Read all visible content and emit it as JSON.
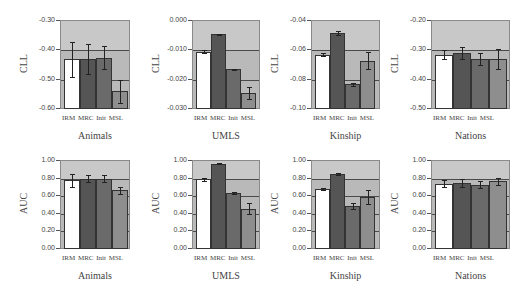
{
  "chart_data": [
    {
      "type": "bar",
      "panel": "top-1",
      "title": "Animals",
      "ylabel": "CLL",
      "categories": [
        "IRM",
        "MRC",
        "Init",
        "MSL"
      ],
      "ylim": [
        -0.6,
        -0.3
      ],
      "yticks": [
        "-0.30",
        "-0.40",
        "-0.50",
        "-0.60"
      ],
      "values": [
        -0.43,
        -0.43,
        -0.425,
        -0.54
      ],
      "errors": [
        0.06,
        0.05,
        0.04,
        0.04
      ],
      "grid": true
    },
    {
      "type": "bar",
      "panel": "top-2",
      "title": "UMLS",
      "ylabel": "CLL",
      "categories": [
        "IRM",
        "MRC",
        "Init",
        "MSL"
      ],
      "ylim": [
        -0.03,
        0.0
      ],
      "yticks": [
        "0.000",
        "-0.010",
        "-0.020",
        "-0.030"
      ],
      "values": [
        -0.0105,
        -0.0045,
        -0.0165,
        -0.0245
      ],
      "errors": [
        0.0005,
        0.0002,
        0.0003,
        0.002
      ],
      "grid": true
    },
    {
      "type": "bar",
      "panel": "top-3",
      "title": "Kinship",
      "ylabel": "CLL",
      "categories": [
        "IRM",
        "MRC",
        "Init",
        "MSL"
      ],
      "ylim": [
        -0.1,
        -0.04
      ],
      "yticks": [
        "-0.04",
        "-0.06",
        "-0.08",
        "-0.10"
      ],
      "values": [
        -0.063,
        -0.048,
        -0.083,
        -0.067
      ],
      "errors": [
        0.001,
        0.0015,
        0.001,
        0.006
      ],
      "grid": true
    },
    {
      "type": "bar",
      "panel": "top-4",
      "title": "Nations",
      "ylabel": "CLL",
      "categories": [
        "IRM",
        "MRC",
        "Init",
        "MSL"
      ],
      "ylim": [
        -0.5,
        -0.2
      ],
      "yticks": [
        "-0.20",
        "-0.30",
        "-0.40",
        "-0.50"
      ],
      "values": [
        -0.315,
        -0.31,
        -0.33,
        -0.33
      ],
      "errors": [
        0.015,
        0.02,
        0.02,
        0.035
      ],
      "grid": true
    },
    {
      "type": "bar",
      "panel": "bottom-1",
      "title": "Animals",
      "ylabel": "AUC",
      "categories": [
        "IRM",
        "MRC",
        "Init",
        "MSL"
      ],
      "ylim": [
        0,
        1
      ],
      "yticks": [
        "1.00",
        "0.80",
        "0.60",
        "0.40",
        "0.20",
        "0.00"
      ],
      "values": [
        0.78,
        0.8,
        0.8,
        0.67
      ],
      "errors": [
        0.07,
        0.04,
        0.04,
        0.04
      ],
      "grid": true
    },
    {
      "type": "bar",
      "panel": "bottom-2",
      "title": "UMLS",
      "ylabel": "AUC",
      "categories": [
        "IRM",
        "MRC",
        "Init",
        "MSL"
      ],
      "ylim": [
        0,
        1
      ],
      "yticks": [
        "1.00",
        "0.80",
        "0.60",
        "0.40",
        "0.20",
        "0.00"
      ],
      "values": [
        0.79,
        0.97,
        0.64,
        0.46
      ],
      "errors": [
        0.02,
        0.005,
        0.01,
        0.06
      ],
      "grid": true
    },
    {
      "type": "bar",
      "panel": "bottom-3",
      "title": "Kinship",
      "ylabel": "AUC",
      "categories": [
        "IRM",
        "MRC",
        "Init",
        "MSL"
      ],
      "ylim": [
        0,
        1
      ],
      "yticks": [
        "1.00",
        "0.80",
        "0.60",
        "0.40",
        "0.20",
        "0.00"
      ],
      "values": [
        0.68,
        0.85,
        0.49,
        0.59
      ],
      "errors": [
        0.01,
        0.01,
        0.03,
        0.08
      ],
      "grid": true
    },
    {
      "type": "bar",
      "panel": "bottom-4",
      "title": "Nations",
      "ylabel": "AUC",
      "categories": [
        "IRM",
        "MRC",
        "Init",
        "MSL"
      ],
      "ylim": [
        0,
        1
      ],
      "yticks": [
        "1.00",
        "0.80",
        "0.60",
        "0.40",
        "0.20",
        "0.00"
      ],
      "values": [
        0.74,
        0.75,
        0.73,
        0.77
      ],
      "errors": [
        0.04,
        0.04,
        0.04,
        0.04
      ],
      "grid": true
    }
  ],
  "series_colors": {
    "IRM": "#ffffff",
    "MRC": "#555555",
    "Init": "#6a6a6a",
    "MSL": "#8e8e8e"
  },
  "category_label": "IRM MRC Init MSL"
}
